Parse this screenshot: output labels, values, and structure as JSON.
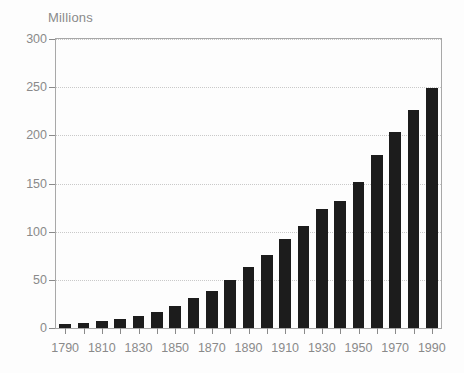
{
  "chart_data": {
    "type": "bar",
    "title": "",
    "subtitle": "",
    "unit_label": "Millions",
    "xlabel": "",
    "ylabel": "",
    "ylim": [
      0,
      300
    ],
    "ytick_values": [
      0,
      50,
      100,
      150,
      200,
      250,
      300
    ],
    "ytick_labels": [
      "0",
      "50",
      "100",
      "150",
      "200",
      "250",
      "300"
    ],
    "grid": "horizontal-dotted",
    "legend": "none",
    "bar_color": "#1c1c1c",
    "axis_color": "#8a8a8a",
    "grid_color": "#c9c9c9",
    "frame_color": "#a8a8a8",
    "categories": [
      "1790",
      "1800",
      "1810",
      "1820",
      "1830",
      "1840",
      "1850",
      "1860",
      "1870",
      "1880",
      "1890",
      "1900",
      "1910",
      "1920",
      "1930",
      "1940",
      "1950",
      "1960",
      "1970",
      "1980",
      "1990"
    ],
    "xtick_labels_shown": [
      "1790",
      "1810",
      "1830",
      "1850",
      "1870",
      "1890",
      "1910",
      "1930",
      "1950",
      "1970",
      "1990"
    ],
    "values": [
      3.9,
      5.3,
      7.2,
      9.6,
      12.9,
      17.1,
      23.2,
      31.4,
      38.6,
      50.2,
      63.0,
      76.2,
      92.2,
      106.0,
      123.2,
      132.2,
      151.3,
      179.3,
      203.3,
      226.5,
      248.7
    ]
  }
}
